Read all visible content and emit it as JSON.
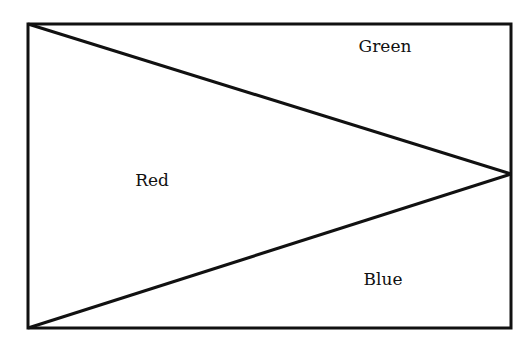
{
  "diagram": {
    "regions": [
      {
        "label": "Green",
        "x": 385,
        "y": 52
      },
      {
        "label": "Red",
        "x": 152,
        "y": 186
      },
      {
        "label": "Blue",
        "x": 383,
        "y": 285
      }
    ],
    "stroke_color": "#111111"
  }
}
